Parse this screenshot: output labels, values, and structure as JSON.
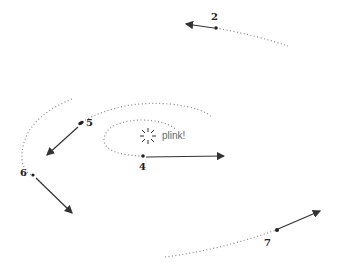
{
  "diagram": {
    "annotation": "plink!",
    "stroke_color": "#333333",
    "path_color": "#888888",
    "points": [
      {
        "id": "p2",
        "label": "2",
        "x": 216,
        "y": 28
      },
      {
        "id": "p5",
        "label": "5",
        "x": 82,
        "y": 122
      },
      {
        "id": "p4",
        "label": "4",
        "x": 143,
        "y": 156
      },
      {
        "id": "p6",
        "label": "6",
        "x": 32,
        "y": 175
      },
      {
        "id": "p7",
        "label": "7",
        "x": 276,
        "y": 230
      }
    ]
  }
}
